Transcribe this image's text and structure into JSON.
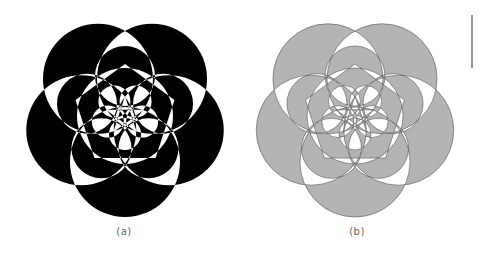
{
  "figures": [
    {
      "id": "a",
      "caption": "(a)",
      "style": "black-white checkerboard",
      "fill_color": "#000000",
      "background_color": "#ffffff"
    },
    {
      "id": "b",
      "caption": "(b)",
      "style": "gray shaded with construction lines",
      "fill_color": "#b4b4b4",
      "stroke_color": "#555555",
      "background_color": "#ffffff"
    }
  ],
  "geometry": {
    "petals": 5,
    "outer_circle_radius": 55,
    "outer_circle_offset": 46,
    "mid_circle_radius": 30,
    "mid_circle_offset": 40,
    "inner_circle_radius": 48,
    "pentagon_radius": 52,
    "star_radius": 20
  }
}
